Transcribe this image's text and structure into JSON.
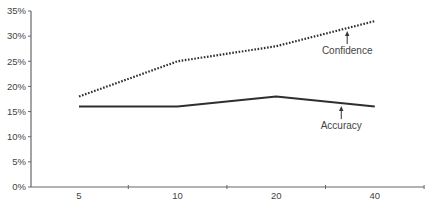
{
  "chart_data": {
    "type": "line",
    "title": "",
    "xlabel": "",
    "ylabel": "",
    "categories": [
      "5",
      "10",
      "20",
      "40"
    ],
    "ylim": [
      0,
      35
    ],
    "y_ticks": [
      0,
      5,
      10,
      15,
      20,
      25,
      30,
      35
    ],
    "y_tick_labels": [
      "0%",
      "5%",
      "10%",
      "15%",
      "20%",
      "25%",
      "30%",
      "35%"
    ],
    "grid": false,
    "legend": "none (inline arrow annotations)",
    "series": [
      {
        "name": "Confidence",
        "style": "dotted",
        "color": "#2f2f2f",
        "values": [
          18,
          25,
          28,
          33
        ],
        "annotation": {
          "text": "Confidence",
          "points_to_category_between": [
            "20",
            "40"
          ]
        }
      },
      {
        "name": "Accuracy",
        "style": "solid",
        "color": "#2f2f2f",
        "values": [
          16,
          16,
          18,
          16
        ],
        "annotation": {
          "text": "Accuracy",
          "points_to_category_between": [
            "20",
            "40"
          ]
        }
      }
    ]
  }
}
